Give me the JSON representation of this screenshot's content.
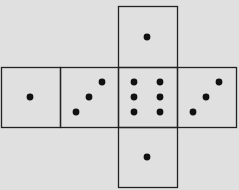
{
  "diagram": {
    "type": "die-net",
    "background": "#e0e0e0",
    "line_color": "#222222",
    "dot_color": "#111111",
    "faces": [
      {
        "name": "top",
        "x": 118,
        "y": 6,
        "w": 59,
        "h": 61,
        "pips": 1,
        "dots": [
          [
            147,
            37
          ]
        ]
      },
      {
        "name": "left",
        "x": 1,
        "y": 67,
        "w": 59,
        "h": 60,
        "pips": 1,
        "dots": [
          [
            30,
            97
          ]
        ]
      },
      {
        "name": "center-left",
        "x": 60,
        "y": 67,
        "w": 58,
        "h": 60,
        "pips": 3,
        "dots": [
          [
            102,
            82
          ],
          [
            89,
            97
          ],
          [
            76,
            112
          ]
        ]
      },
      {
        "name": "center",
        "x": 118,
        "y": 67,
        "w": 59,
        "h": 60,
        "pips": 6,
        "dots": [
          [
            134,
            82
          ],
          [
            160,
            82
          ],
          [
            134,
            97
          ],
          [
            160,
            97
          ],
          [
            134,
            112
          ],
          [
            160,
            112
          ]
        ]
      },
      {
        "name": "right",
        "x": 177,
        "y": 67,
        "w": 59,
        "h": 60,
        "pips": 3,
        "dots": [
          [
            219,
            82
          ],
          [
            206,
            97
          ],
          [
            193,
            112
          ]
        ]
      },
      {
        "name": "bottom",
        "x": 118,
        "y": 127,
        "w": 59,
        "h": 60,
        "pips": 1,
        "dots": [
          [
            147,
            157
          ]
        ]
      }
    ]
  }
}
